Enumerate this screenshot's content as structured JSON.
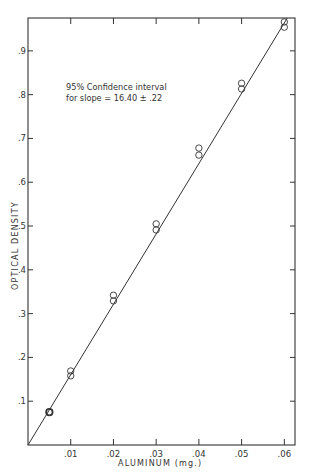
{
  "chart_data": {
    "type": "scatter",
    "title": "",
    "xlabel": "ALUMINUM (mg.)",
    "ylabel": "OPTICAL DENSITY",
    "xlim": [
      0,
      0.0625
    ],
    "ylim": [
      0,
      0.975
    ],
    "grid": false,
    "legend": null,
    "x_ticks": [
      0.01,
      0.02,
      0.03,
      0.04,
      0.05,
      0.06
    ],
    "x_tick_labels": [
      ".01",
      ".02",
      ".03",
      ".04",
      ".05",
      ".06"
    ],
    "y_ticks": [
      0.1,
      0.2,
      0.3,
      0.4,
      0.5,
      0.6,
      0.7,
      0.8,
      0.9
    ],
    "y_tick_labels": [
      ".1",
      ".2",
      ".3",
      ".4",
      ".5",
      ".6",
      ".7",
      ".8",
      ".9"
    ],
    "annotation": {
      "line1": "95% Confidence interval",
      "line2": "for slope = 16.40 ± .22"
    },
    "series": [
      {
        "name": "measurements",
        "marker": "open-circle",
        "points": [
          {
            "x": 0.005,
            "y": 0.075,
            "bold": true
          },
          {
            "x": 0.01,
            "y": 0.169
          },
          {
            "x": 0.01,
            "y": 0.158
          },
          {
            "x": 0.02,
            "y": 0.342
          },
          {
            "x": 0.02,
            "y": 0.329
          },
          {
            "x": 0.03,
            "y": 0.505
          },
          {
            "x": 0.03,
            "y": 0.491
          },
          {
            "x": 0.04,
            "y": 0.678
          },
          {
            "x": 0.04,
            "y": 0.662
          },
          {
            "x": 0.05,
            "y": 0.826
          },
          {
            "x": 0.05,
            "y": 0.813
          },
          {
            "x": 0.06,
            "y": 0.966
          },
          {
            "x": 0.06,
            "y": 0.954
          }
        ]
      },
      {
        "name": "fit line",
        "type": "line",
        "slope": 16.4,
        "points": [
          {
            "x": 0.0,
            "y": 0.0
          },
          {
            "x": 0.0607,
            "y": 0.975
          }
        ]
      }
    ]
  }
}
